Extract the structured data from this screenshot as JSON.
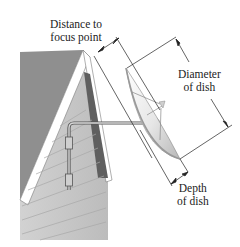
{
  "figure": {
    "labels": {
      "focus_line1": "Distance to",
      "focus_line2": "focus point",
      "diameter_line1": "Diameter",
      "diameter_line2": "of dish",
      "depth_line1": "Depth",
      "depth_line2": "of dish"
    },
    "colors": {
      "roof_dark": "#8f8f8f",
      "roof_shadow": "#5f5f5f",
      "siding": "#c9c9c9",
      "trim": "#ffffff",
      "dish_light": "#f2f2f2",
      "dish_shadow": "#bdbdbd",
      "line": "#222222"
    }
  }
}
